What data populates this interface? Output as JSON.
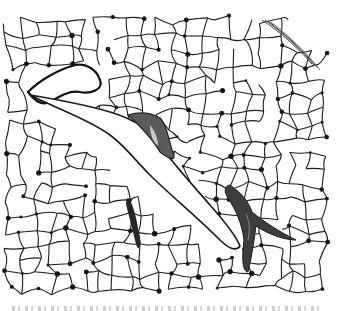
{
  "figure": {
    "kind": "histology-micrograph",
    "stain_colors": {
      "background": "#ffffff",
      "alveolar_wall": "#1a1a1a",
      "vessel_dark": "#3a3a3a",
      "vessel_mid": "#6e6e6e",
      "vessel_light": "#a8a8a8"
    },
    "structures": [
      {
        "name": "alveolar-network",
        "description": "fine meshwork of alveolar septa across the section"
      },
      {
        "name": "airway-upper-left",
        "description": "large branching airway lumen in upper-left region"
      },
      {
        "name": "airway-central-diagonal",
        "description": "elongated diagonal airway lumen crossing the center"
      },
      {
        "name": "vessel-center",
        "description": "small dark-stained blood vessel with pale lumen near center"
      },
      {
        "name": "vessel-lower-right",
        "description": "large branching dark-stained vessel in lower right"
      },
      {
        "name": "vessel-lower-left",
        "description": "narrow dark vessel segment lower left"
      },
      {
        "name": "pleura-upper-right",
        "description": "striated pleural edge at upper right"
      }
    ]
  },
  "caption": {
    "visible": "partial",
    "text": ""
  }
}
